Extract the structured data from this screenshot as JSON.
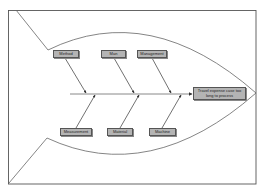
{
  "diagram": {
    "type": "fishbone",
    "effect": "Travel expense case too long to process",
    "categories_top": [
      "Method",
      "Man",
      "Management"
    ],
    "categories_bottom": [
      "Measurement",
      "Material",
      "Machine"
    ],
    "colors": {
      "box_fill": "#b4b4b4",
      "box_border": "#555555",
      "lines": "#555555",
      "background": "#ffffff"
    }
  }
}
